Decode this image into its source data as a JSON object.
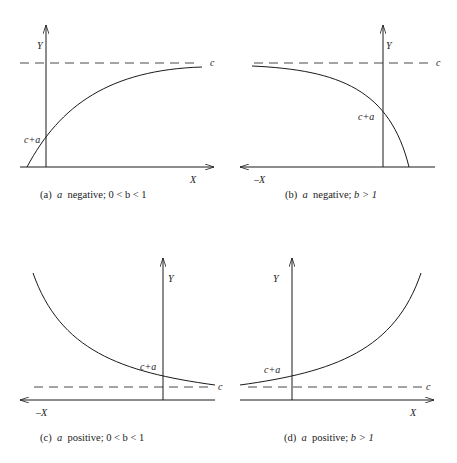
{
  "panels": [
    {
      "id": "a",
      "caption": {
        "prefix": "(a)",
        "a": "a",
        "sign": "negative;",
        "cond": "0 < b < 1"
      },
      "labels": {
        "y_axis": "Y",
        "x_axis": "X",
        "asymptote": "c",
        "intercept": "c+a"
      }
    },
    {
      "id": "b",
      "caption": {
        "prefix": "(b)",
        "a": "a",
        "sign": "negative;",
        "cond": "b > 1"
      },
      "labels": {
        "y_axis": "Y",
        "x_axis": "–X",
        "asymptote": "c",
        "intercept": "c+a"
      }
    },
    {
      "id": "c",
      "caption": {
        "prefix": "(c)",
        "a": "a",
        "sign": "positive;",
        "cond": "0 < b < 1"
      },
      "labels": {
        "y_axis": "Y",
        "x_axis": "–X",
        "asymptote": "c",
        "intercept": "c+a"
      }
    },
    {
      "id": "d",
      "caption": {
        "prefix": "(d)",
        "a": "a",
        "sign": "positive;",
        "cond": "b > 1"
      },
      "labels": {
        "y_axis": "Y",
        "x_axis": "X",
        "asymptote": "c",
        "intercept": "c+a"
      }
    }
  ],
  "colors": {
    "ink": "#1a1a1a"
  }
}
